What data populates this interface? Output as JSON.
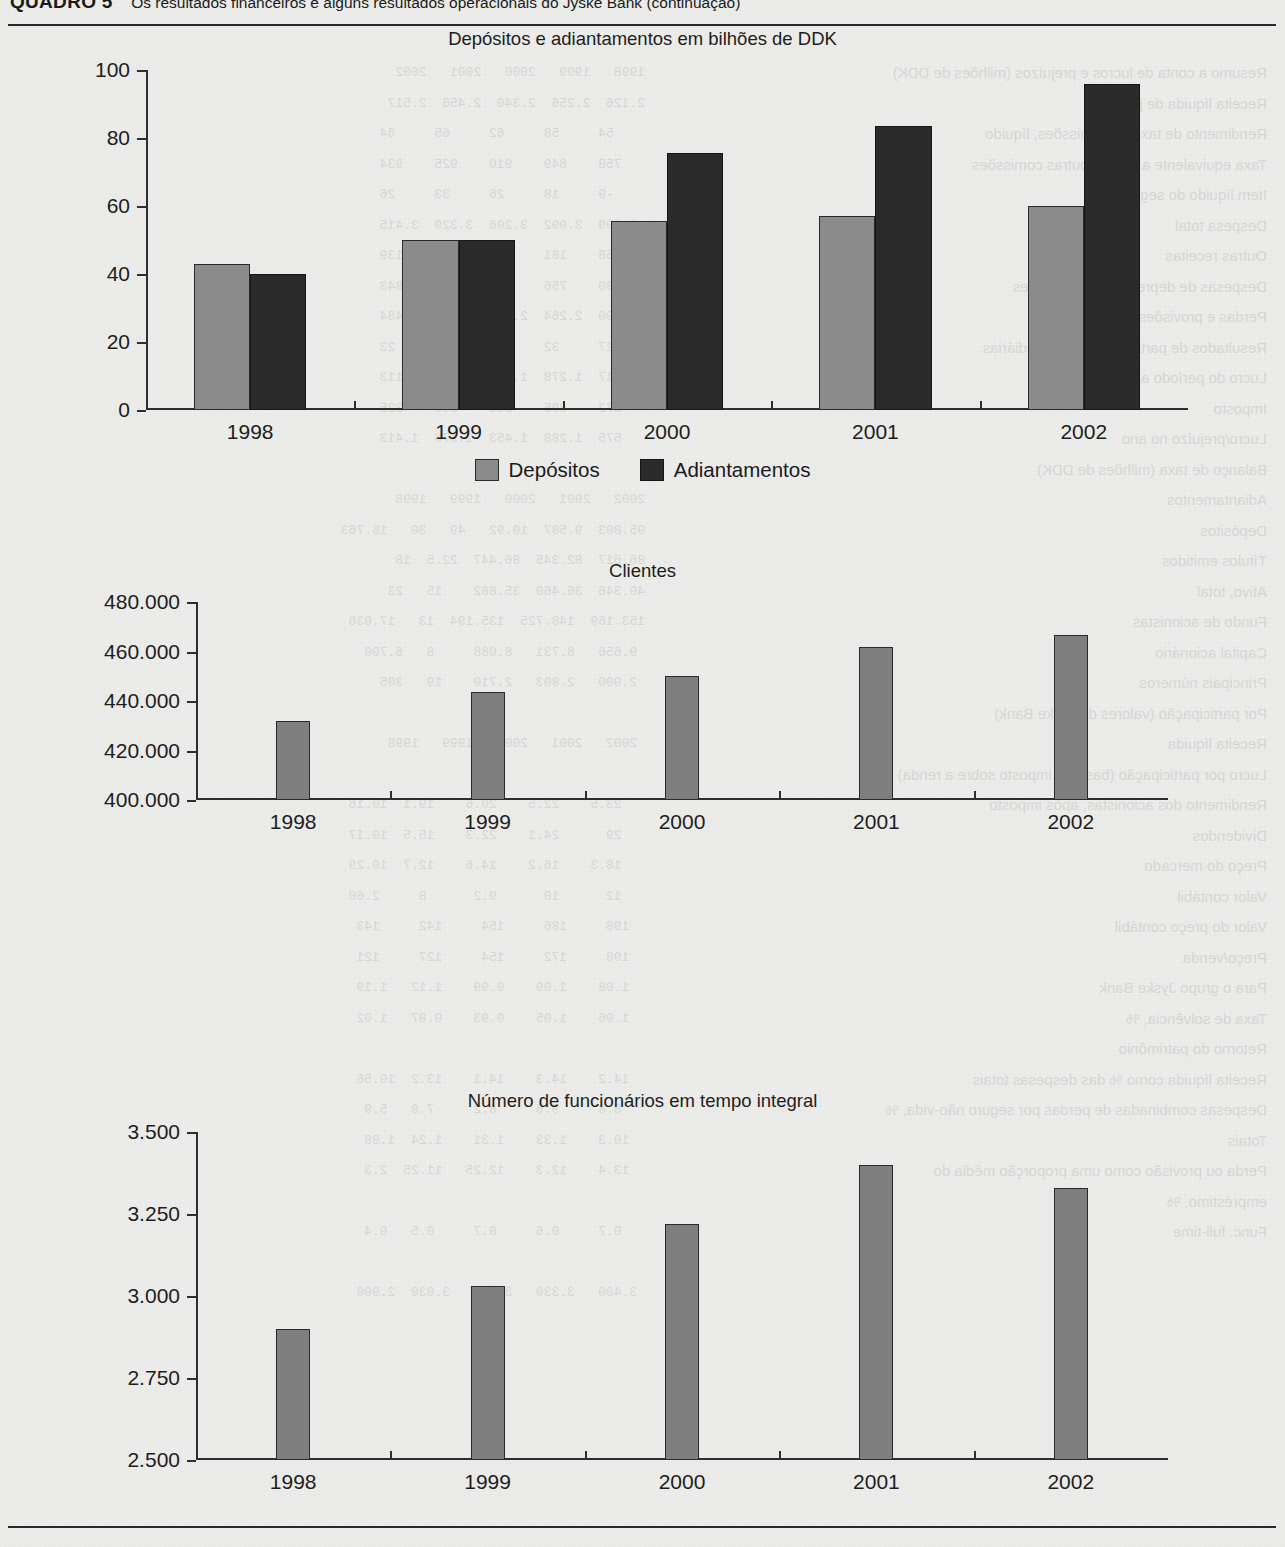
{
  "header": {
    "label": "QUADRO 5",
    "title": "Os resultados financeiros e alguns resultados operacionais do Jyske Bank (continuação)"
  },
  "bleed_text": {
    "left": "Resumo a conta de lucros e prejuízos (milhões de DDK)\nReceita líquida de juros\nRendimento de taxas e comissões, líquido\nTaxa equivalente a juros e outras comissões\nItem líquido do seguro\nDespesa total\nOutras receitas\nDespesas de depreciação e provisões\nPerdas e provisões sobre débitos\nResultados de participações e subsidiárias\nLucro do período antes de impostos\nImposto\nLucro/prejuízo no ano\nBalanço de taxa (milhões de DDK)\nAdiantamentos\nDepósitos\nTítulos emitidos\nAtivo, total\nFundo de acionistas\nCapital acionário\nPrincipais números\nPor participação (valores do Jyske Bank)\nReceita líquida\nLucro por participação (base do imposto sobre a renda)\nRendimento dos acionistas, após imposto\nDividendos\nPreço do mercado\nValor contábil\nValor do preço contábil\nPreço/venda\nPara o grupo Jyske Bank\nTaxa de solvência, %\nRetorno do patrimônio\nReceita líquida como % das despesas totais\nDespesas combinadas de perdas por seguro não-vida, %\nTotais\nPerda ou provisão como uma proporção média do\nempréstimo, %\nFunc. full-time",
    "right": "1998   1999   2000   2001   2002\n2.126  2.256  2.340  2.456  2.517\n    54     58     62     65     64\n   758    849    910    925    934\n    -9     18     26     33     26\n 2.909  3.092  3.206  3.329  3.415\n   158    181    224    191    139\n   730    756    809    834    843\n 2.500  2.264  2.331  2.435  2.484\n    27     32     29     18     23\n 1.117  1.278  1.332  1.269  1.113\n   372    395    366    335    325\n   575  1.288  1.453  1.576  1.413\n\n2002   2001   2000   1999   1998\n95.803  9.587  10.92   49   30   18.763\n86.617  82.345  86.447  22.5  18\n40.346  36.460  35.882    15   23\n153.169  148.725  135.194  13   17.036\n 9.656   8.731   8.088     8   6.700\n 2.900   2.803   2.710    19   305\n\n 2002   2001   2000   1999   1998\n\n   23.5    22.5    20.6    19.1  10.16\n   29      24.1    22.3    15.5  10.17\n   18.3    16.2    14.6    12.7  10.29\n   12      10      9.2      8     2.60\n  198     186     154     142     143\n  198     172     154     127     121\n  1.08    1.09    0.99    1.12   1.19\n  1.06    1.05    0.93    0.87   1.02\n\n  14.2    14.3    14.1    13.2  10.56\n   8.8     9.6     8.2     7.0   5.9\n  10.3    1.33    1.31    1.24  1.98\n  13.4    12.3    12.25   11.25  2.3\n\n   0.7     0.6     0.7     0.5   0.4\n\n 3.400   3.330   3.220   3.030  2.900"
  },
  "charts": [
    {
      "id": "depositos-adiantamentos",
      "chart_data": {
        "type": "bar",
        "title": "Depósitos e adiantamentos em bilhões de DDK",
        "xlabel": "",
        "ylabel": "",
        "ylim": [
          0,
          100
        ],
        "yticks": [
          0,
          20,
          40,
          60,
          80,
          100
        ],
        "ytick_labels": [
          "0",
          "20",
          "40",
          "60",
          "80",
          "100"
        ],
        "categories": [
          "1998",
          "1999",
          "2000",
          "2001",
          "2002"
        ],
        "series": [
          {
            "name": "Depósitos",
            "color": "#8b8b8b",
            "values": [
              43,
              50,
              55.5,
              57,
              60
            ]
          },
          {
            "name": "Adiantamentos",
            "color": "#2b2b2b",
            "values": [
              40,
              50,
              75.5,
              83.5,
              96
            ]
          }
        ],
        "legend_position": "bottom-center",
        "grid": false
      }
    },
    {
      "id": "clientes",
      "chart_data": {
        "type": "bar",
        "title": "Clientes",
        "xlabel": "",
        "ylabel": "",
        "ylim": [
          400000,
          480000
        ],
        "yticks": [
          400000,
          420000,
          440000,
          460000,
          480000
        ],
        "ytick_labels": [
          "400.000",
          "420.000",
          "440.000",
          "460.000",
          "480.000"
        ],
        "categories": [
          "1998",
          "1999",
          "2000",
          "2001",
          "2002"
        ],
        "series": [
          {
            "name": "Clientes",
            "color": "#7f7f7f",
            "values": [
              432000,
              443500,
              450200,
              462000,
              466500
            ]
          }
        ],
        "legend_position": "none",
        "grid": false
      }
    },
    {
      "id": "funcionarios",
      "chart_data": {
        "type": "bar",
        "title": "Número de funcionários em tempo integral",
        "xlabel": "",
        "ylabel": "",
        "ylim": [
          2500,
          3500
        ],
        "yticks": [
          2500,
          2750,
          3000,
          3250,
          3500
        ],
        "ytick_labels": [
          "2.500",
          "2.750",
          "3.000",
          "3.250",
          "3.500"
        ],
        "categories": [
          "1998",
          "1999",
          "2000",
          "2001",
          "2002"
        ],
        "series": [
          {
            "name": "Funcionários",
            "color": "#7f7f7f",
            "values": [
              2900,
              3030,
              3220,
              3400,
              3330
            ]
          }
        ],
        "legend_position": "none",
        "grid": false
      }
    }
  ]
}
